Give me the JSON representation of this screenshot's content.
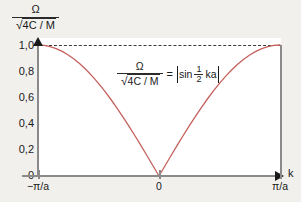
{
  "chart_data": {
    "type": "line",
    "title": "",
    "annotation": "Ω/√(4C/M) = |sin ½ka|",
    "ylabel_numerator": "Ω",
    "ylabel_denominator_radicand": "4C / M",
    "xlabel": "k",
    "xlim": [
      -1,
      1
    ],
    "ylim": [
      0,
      1.05
    ],
    "grid": false,
    "legend": "none",
    "x_tick_labels": [
      "−π/a",
      "0",
      "π/a"
    ],
    "x_tick_values": [
      -1,
      0,
      1
    ],
    "y_tick_labels": [
      "0",
      "0,2",
      "0,4",
      "0,6",
      "0,8",
      "1,0"
    ],
    "y_tick_values": [
      0,
      0.2,
      0.4,
      0.6,
      0.8,
      1.0
    ],
    "curve_color": "#c4615c",
    "axis_color": "#8a8a8a",
    "reference_line": {
      "y": 1.0,
      "style": "dashed",
      "color": "#3a3a3a"
    },
    "x": [
      -1.0,
      -0.95,
      -0.9,
      -0.85,
      -0.8,
      -0.75,
      -0.7,
      -0.65,
      -0.6,
      -0.55,
      -0.5,
      -0.45,
      -0.4,
      -0.35,
      -0.3,
      -0.25,
      -0.2,
      -0.15,
      -0.1,
      -0.05,
      0.0,
      0.05,
      0.1,
      0.15,
      0.2,
      0.25,
      0.3,
      0.35,
      0.4,
      0.45,
      0.5,
      0.55,
      0.6,
      0.65,
      0.7,
      0.75,
      0.8,
      0.85,
      0.9,
      0.95,
      1.0
    ],
    "values": [
      1.0,
      0.9969,
      0.9877,
      0.9724,
      0.9511,
      0.9239,
      0.891,
      0.8526,
      0.809,
      0.7604,
      0.7071,
      0.6494,
      0.5878,
      0.5225,
      0.454,
      0.3827,
      0.309,
      0.2334,
      0.1564,
      0.0785,
      0.0,
      0.0785,
      0.1564,
      0.2334,
      0.309,
      0.3827,
      0.454,
      0.5225,
      0.5878,
      0.6494,
      0.7071,
      0.7604,
      0.809,
      0.8526,
      0.891,
      0.9239,
      0.9511,
      0.9724,
      0.9877,
      0.9969,
      1.0
    ]
  },
  "equation": {
    "numerator": "Ω",
    "radical_glyph": "√",
    "radicand": "4C / M",
    "equals": "=",
    "sin": "sin",
    "half_num": "1",
    "half_den": "2",
    "ka": "ka",
    "abs_bar": "|"
  },
  "axis_title": {
    "y_numerator": "Ω",
    "y_radical_glyph": "√",
    "y_radicand": "4C / M",
    "x_name": "k"
  }
}
